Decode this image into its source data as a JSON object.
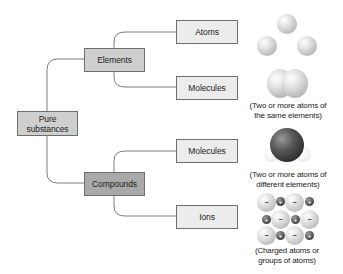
{
  "root": {
    "label_line1": "Pure",
    "label_line2": "substances"
  },
  "categories": [
    {
      "label": "Elements"
    },
    {
      "label": "Compounds"
    }
  ],
  "leaves": [
    {
      "label": "Atoms"
    },
    {
      "label": "Molecules"
    },
    {
      "label": "Molecules"
    },
    {
      "label": "Ions"
    }
  ],
  "captions": [
    {
      "line1": "(Two or more atoms of",
      "line2": "the same elements)"
    },
    {
      "line1": "(Two or more atoms of",
      "line2": "different elements)"
    },
    {
      "line1": "(Charged atoms or",
      "line2": "groups of atoms)"
    }
  ],
  "ion_signs": {
    "anion": "−",
    "cation": "+"
  },
  "colors": {
    "root_fill": "#cfcfcf",
    "elements_fill": "#cfcfcf",
    "compounds_fill": "#a9a9a9",
    "leaf_fill": "#ececec",
    "line": "#6e6e6e"
  }
}
